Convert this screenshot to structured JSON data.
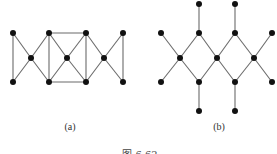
{
  "figure": {
    "caption": "图 6.62",
    "graphs": [
      {
        "id": "a",
        "label": "(a)",
        "label_pos": [
          70,
          130
        ],
        "nodes": [
          [
            13,
            33
          ],
          [
            49,
            33
          ],
          [
            86,
            33
          ],
          [
            123,
            33
          ],
          [
            31,
            58
          ],
          [
            67,
            58
          ],
          [
            104,
            58
          ],
          [
            13,
            82
          ],
          [
            49,
            82
          ],
          [
            86,
            82
          ],
          [
            123,
            82
          ]
        ],
        "edges": [
          [
            0,
            7
          ],
          [
            0,
            4
          ],
          [
            7,
            4
          ],
          [
            4,
            1
          ],
          [
            4,
            8
          ],
          [
            1,
            8
          ],
          [
            1,
            2
          ],
          [
            8,
            9
          ],
          [
            1,
            5
          ],
          [
            8,
            5
          ],
          [
            5,
            2
          ],
          [
            5,
            9
          ],
          [
            2,
            9
          ],
          [
            2,
            6
          ],
          [
            9,
            6
          ],
          [
            6,
            3
          ],
          [
            6,
            10
          ],
          [
            3,
            10
          ]
        ]
      },
      {
        "id": "b",
        "label": "(b)",
        "label_pos": [
          219,
          130
        ],
        "nodes": [
          [
            199,
            4
          ],
          [
            235,
            4
          ],
          [
            161,
            33
          ],
          [
            199,
            33
          ],
          [
            235,
            33
          ],
          [
            272,
            33
          ],
          [
            180,
            58
          ],
          [
            217,
            58
          ],
          [
            254,
            58
          ],
          [
            161,
            82
          ],
          [
            199,
            82
          ],
          [
            235,
            82
          ],
          [
            272,
            82
          ],
          [
            199,
            111
          ],
          [
            235,
            111
          ]
        ],
        "edges": [
          [
            0,
            3
          ],
          [
            1,
            4
          ],
          [
            2,
            6
          ],
          [
            3,
            6
          ],
          [
            3,
            7
          ],
          [
            4,
            7
          ],
          [
            4,
            8
          ],
          [
            5,
            8
          ],
          [
            6,
            9
          ],
          [
            6,
            10
          ],
          [
            7,
            10
          ],
          [
            7,
            11
          ],
          [
            8,
            11
          ],
          [
            8,
            12
          ],
          [
            10,
            13
          ],
          [
            11,
            14
          ]
        ]
      }
    ],
    "style": {
      "edge_color": "#6b6b6b",
      "node_color": "#111111",
      "node_radius": 3
    }
  }
}
